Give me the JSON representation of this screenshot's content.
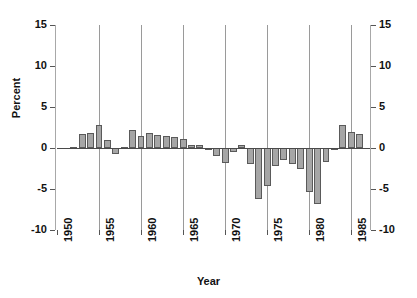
{
  "chart_data": {
    "type": "bar",
    "title": "",
    "xlabel": "Year",
    "ylabel": "Percent",
    "xlim": [
      1950,
      1987
    ],
    "ylim": [
      -10,
      15
    ],
    "yticks": [
      15,
      10,
      5,
      0,
      -5,
      -10
    ],
    "yticks_right": [
      15,
      10,
      5,
      0,
      -5,
      -10
    ],
    "xticks": [
      1950,
      1955,
      1960,
      1965,
      1970,
      1975,
      1980,
      1985
    ],
    "grid": "vertical-at-xticks",
    "legend": "none",
    "bar_color": "#a6a6a6",
    "bar_edge_color": "#5a5a5a",
    "axis_color": "#a8a8a8",
    "categories": [
      1952,
      1953,
      1954,
      1955,
      1956,
      1957,
      1958,
      1959,
      1960,
      1961,
      1962,
      1963,
      1964,
      1965,
      1966,
      1967,
      1968,
      1969,
      1970,
      1971,
      1972,
      1973,
      1974,
      1975,
      1976,
      1977,
      1978,
      1979,
      1980,
      1981,
      1982,
      1983,
      1984,
      1985,
      1986
    ],
    "values": [
      0.1,
      1.7,
      1.8,
      2.8,
      1.0,
      -0.7,
      0.1,
      2.2,
      1.5,
      1.8,
      1.6,
      1.5,
      1.4,
      1.1,
      0.4,
      0.4,
      -0.3,
      -1.0,
      -1.8,
      -0.5,
      0.4,
      -2.0,
      -6.2,
      -4.6,
      -2.2,
      -1.5,
      -2.0,
      -2.6,
      -5.4,
      -6.8,
      -1.7,
      -0.2,
      2.8,
      2.0,
      1.7
    ],
    "last_bar_value": 2.8,
    "series_name": "Percent"
  },
  "labels": {
    "y_axis_title": "Percent",
    "x_axis_title": "Year"
  }
}
